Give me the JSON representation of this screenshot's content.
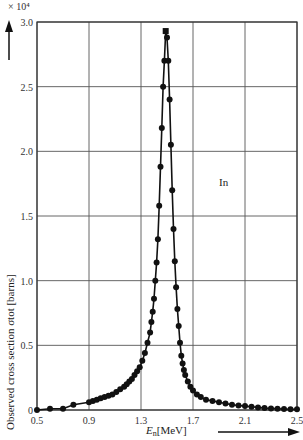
{
  "chart_data": {
    "type": "line",
    "title": "",
    "annotation": "In",
    "xlabel": "E_n [MeV]",
    "ylabel": "Observed cross section σ_tot [barns]",
    "y_multiplier": "× 10⁴",
    "xlim": [
      0.5,
      2.5
    ],
    "ylim": [
      0,
      3.0
    ],
    "x_ticks": [
      "0.5",
      "0.9",
      "1.3",
      "1.7",
      "2.1",
      "2.5"
    ],
    "y_ticks": [
      "0",
      "0.5",
      "1.0",
      "1.5",
      "2.0",
      "2.5",
      "3.0"
    ],
    "grid": true,
    "series": [
      {
        "name": "In",
        "x": [
          0.5,
          0.6,
          0.7,
          0.78,
          0.9,
          0.93,
          0.96,
          0.99,
          1.02,
          1.05,
          1.08,
          1.11,
          1.14,
          1.17,
          1.19,
          1.21,
          1.23,
          1.25,
          1.27,
          1.29,
          1.31,
          1.33,
          1.35,
          1.37,
          1.38,
          1.39,
          1.4,
          1.41,
          1.42,
          1.43,
          1.44,
          1.45,
          1.46,
          1.47,
          1.48,
          1.49,
          1.5,
          1.51,
          1.52,
          1.53,
          1.54,
          1.55,
          1.56,
          1.57,
          1.58,
          1.59,
          1.6,
          1.61,
          1.62,
          1.63,
          1.64,
          1.66,
          1.68,
          1.7,
          1.73,
          1.76,
          1.8,
          1.85,
          1.9,
          1.95,
          2.0,
          2.05,
          2.1,
          2.15,
          2.2,
          2.25,
          2.3,
          2.35,
          2.4,
          2.45,
          2.5
        ],
        "values": [
          0.0,
          0.01,
          0.01,
          0.04,
          0.06,
          0.07,
          0.08,
          0.09,
          0.1,
          0.11,
          0.12,
          0.14,
          0.16,
          0.18,
          0.2,
          0.22,
          0.24,
          0.27,
          0.3,
          0.33,
          0.38,
          0.44,
          0.52,
          0.6,
          0.68,
          0.76,
          0.86,
          1.0,
          1.14,
          1.32,
          1.58,
          1.88,
          2.18,
          2.5,
          2.7,
          2.93,
          2.88,
          2.7,
          2.4,
          2.05,
          1.7,
          1.4,
          1.15,
          0.95,
          0.78,
          0.65,
          0.52,
          0.42,
          0.36,
          0.31,
          0.27,
          0.22,
          0.18,
          0.15,
          0.12,
          0.1,
          0.08,
          0.07,
          0.06,
          0.05,
          0.04,
          0.035,
          0.03,
          0.025,
          0.02,
          0.015,
          0.012,
          0.01,
          0.008,
          0.006,
          0.005
        ]
      }
    ]
  },
  "labels": {
    "y_multiplier": "× 10⁴",
    "ylabel": "Observed cross section σtot [barns]",
    "xlabel_main": "E",
    "xlabel_sub": "n",
    "xlabel_unit": "[MeV]",
    "annotation": "In"
  }
}
